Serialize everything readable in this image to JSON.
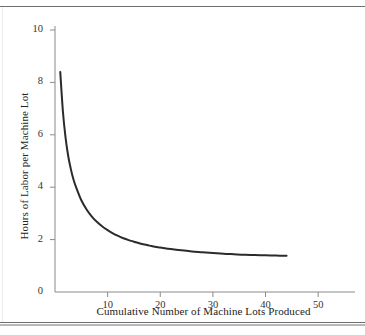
{
  "figure": {
    "name": "learning-curve-figure",
    "background": "#ffffff",
    "axis_color": "#8a8a8a",
    "curve_color": "#2b2b2b",
    "rule_color": "#6f6f6f"
  },
  "chart_data": {
    "type": "line",
    "title": "",
    "subtitle": "",
    "xlabel": "Cumulative Number of Machine Lots Produced",
    "ylabel": "Hours of Labor per Machine Lot",
    "xlim": [
      0,
      57
    ],
    "ylim": [
      0,
      10
    ],
    "xticks": [
      10,
      20,
      30,
      40,
      50
    ],
    "xtick_labels": [
      "10",
      "20",
      "30",
      "40",
      "50"
    ],
    "yticks": [
      0,
      2,
      4,
      6,
      8,
      10
    ],
    "ytick_labels": [
      "0",
      "2",
      "4",
      "6",
      "8",
      "10"
    ],
    "grid": false,
    "legend": false,
    "legend_position": "none",
    "annotations": [],
    "series": [
      {
        "name": "Labor hours per machine lot",
        "color": "#2b2b2b",
        "line_width": 2.0,
        "x": [
          1,
          1.5,
          2,
          2.5,
          3,
          3.5,
          4,
          5,
          6,
          7,
          8,
          9,
          10,
          11,
          12,
          13,
          14,
          15,
          16,
          17,
          18,
          19,
          20,
          22,
          24,
          26,
          28,
          30,
          32,
          34,
          36,
          38,
          40,
          42,
          44
        ],
        "y": [
          8.4,
          6.9,
          5.9,
          5.2,
          4.7,
          4.3,
          4.0,
          3.5,
          3.15,
          2.88,
          2.67,
          2.5,
          2.36,
          2.24,
          2.14,
          2.05,
          1.98,
          1.92,
          1.86,
          1.81,
          1.77,
          1.73,
          1.7,
          1.64,
          1.59,
          1.55,
          1.52,
          1.49,
          1.46,
          1.44,
          1.42,
          1.41,
          1.4,
          1.39,
          1.38
        ]
      }
    ]
  },
  "ticks": {
    "y": [
      {
        "label": "10",
        "value": 10
      },
      {
        "label": "8",
        "value": 8
      },
      {
        "label": "6",
        "value": 6
      },
      {
        "label": "4",
        "value": 4
      },
      {
        "label": "2",
        "value": 2
      },
      {
        "label": "0",
        "value": 0
      }
    ],
    "x": [
      {
        "label": "10",
        "value": 10
      },
      {
        "label": "20",
        "value": 20
      },
      {
        "label": "30",
        "value": 30
      },
      {
        "label": "40",
        "value": 40
      },
      {
        "label": "50",
        "value": 50
      }
    ]
  }
}
